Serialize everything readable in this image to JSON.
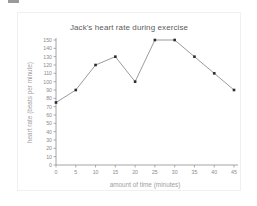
{
  "chart_data": {
    "type": "line",
    "title": "Jack's heart rate during exercise",
    "xlabel": "amount of time (minutes)",
    "ylabel": "heart rate (beats per minute)",
    "x": [
      0,
      5,
      10,
      15,
      20,
      25,
      30,
      35,
      40,
      45
    ],
    "values": [
      75,
      90,
      120,
      130,
      100,
      150,
      150,
      130,
      110,
      90
    ],
    "xlim": [
      0,
      45
    ],
    "ylim": [
      0,
      150
    ],
    "xticks": [
      "0",
      "5",
      "10",
      "15",
      "20",
      "25",
      "30",
      "35",
      "40",
      "45"
    ],
    "yticks": [
      "0",
      "10",
      "20",
      "30",
      "40",
      "50",
      "60",
      "70",
      "80",
      "90",
      "100",
      "110",
      "120",
      "130",
      "140",
      "150"
    ],
    "grid": false,
    "legend": null,
    "series_color": "#8e8e96",
    "marker_color": "#2b2b33",
    "axis_color": "#8d8d8d",
    "title_color": "#5c5c5c",
    "label_color": "#a0a0a0"
  }
}
